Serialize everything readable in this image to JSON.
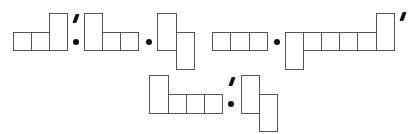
{
  "diagram": {
    "stroke_color": "#555555",
    "mark_color": "#111111",
    "row1": {
      "terms": [
        {
          "shape": "tableau-3-with-last-tall-up",
          "cells": 3,
          "primed": true
        },
        {
          "operator": "dot"
        },
        {
          "shape": "tableau-tall-then-2",
          "cells": 3
        },
        {
          "operator": "dot"
        },
        {
          "shape": "tableau-2-tall-staggered",
          "cells": 2
        },
        {
          "shape": "tableau-3-row",
          "cells": 3
        },
        {
          "operator": "dot"
        },
        {
          "shape": "tableau-tall-down-4-tall-up",
          "cells": 6,
          "primed": true
        }
      ]
    },
    "row2": {
      "terms": [
        {
          "shape": "tableau-tall-then-3",
          "cells": 4,
          "primed": true
        },
        {
          "operator": "dot"
        },
        {
          "shape": "tableau-2-tall-staggered",
          "cells": 2
        }
      ]
    }
  }
}
